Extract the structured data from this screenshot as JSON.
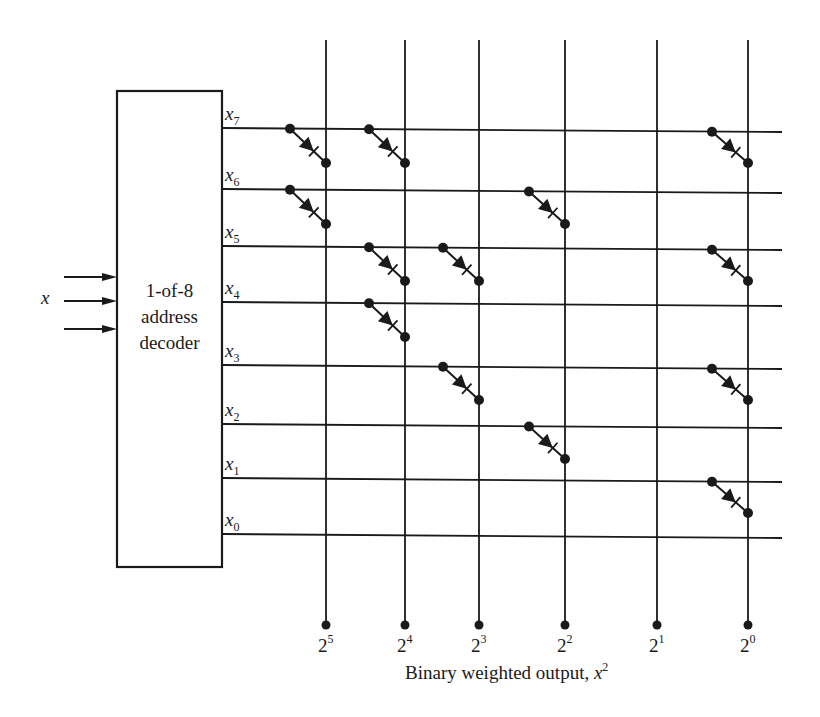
{
  "decoder": {
    "label_lines": [
      "1-of-8",
      "address",
      "decoder"
    ],
    "input_label": "x",
    "input_count": 3
  },
  "rows": [
    {
      "name": "x",
      "sub": "7",
      "value": 7,
      "y": 128
    },
    {
      "name": "x",
      "sub": "6",
      "value": 6,
      "y": 189
    },
    {
      "name": "x",
      "sub": "5",
      "value": 5,
      "y": 246
    },
    {
      "name": "x",
      "sub": "4",
      "value": 4,
      "y": 302
    },
    {
      "name": "x",
      "sub": "3",
      "value": 3,
      "y": 365
    },
    {
      "name": "x",
      "sub": "2",
      "value": 2,
      "y": 424
    },
    {
      "name": "x",
      "sub": "1",
      "value": 1,
      "y": 478
    },
    {
      "name": "x",
      "sub": "0",
      "value": 0,
      "y": 534
    }
  ],
  "columns": [
    {
      "base": "2",
      "exp": "5",
      "x": 326
    },
    {
      "base": "2",
      "exp": "4",
      "x": 405
    },
    {
      "base": "2",
      "exp": "3",
      "x": 479
    },
    {
      "base": "2",
      "exp": "2",
      "x": 565
    },
    {
      "base": "2",
      "exp": "1",
      "x": 657
    },
    {
      "base": "2",
      "exp": "0",
      "x": 748
    }
  ],
  "diodes": [
    {
      "row": 7,
      "cols": [
        5,
        4,
        0
      ]
    },
    {
      "row": 6,
      "cols": [
        5,
        2
      ]
    },
    {
      "row": 5,
      "cols": [
        4,
        3,
        0
      ]
    },
    {
      "row": 4,
      "cols": [
        4
      ]
    },
    {
      "row": 3,
      "cols": [
        3,
        0
      ]
    },
    {
      "row": 2,
      "cols": [
        2
      ]
    },
    {
      "row": 1,
      "cols": [
        0
      ]
    },
    {
      "row": 0,
      "cols": []
    }
  ],
  "output_caption": {
    "text": "Binary weighted output, ",
    "var": "x",
    "exp": "2"
  },
  "colors": {
    "ink": "#1a1a1a",
    "background": "#ffffff"
  }
}
